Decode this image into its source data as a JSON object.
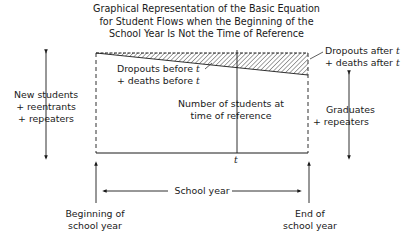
{
  "title": {
    "line1": "Graphical Representation of the Basic Equation",
    "line2": "for Student Flows when the Beginning of the",
    "line3": "School Year Is Not the Time of Reference"
  },
  "left_inflow": {
    "line1": "New students",
    "line2": "+ reentrants",
    "line3": "+ repeaters"
  },
  "dropouts_before": {
    "line1": "Dropouts before",
    "line2": "+ deaths before",
    "var": "t"
  },
  "dropouts_after": {
    "line1": "Dropouts after",
    "line2": "+ deaths after",
    "var": "t"
  },
  "students_at_reference": {
    "line1": "Number of students at",
    "line2": "time of reference"
  },
  "right_outflow": {
    "line1": "Graduates",
    "line2": "+ repeaters"
  },
  "axis": {
    "t_label": "t",
    "school_year": "School year",
    "beginning": {
      "line1": "Beginning  of",
      "line2": "school year"
    },
    "end": {
      "line1": "End of",
      "line2": "school year"
    }
  },
  "colors": {
    "ink": "#1a1a1a",
    "background": "#ffffff"
  }
}
